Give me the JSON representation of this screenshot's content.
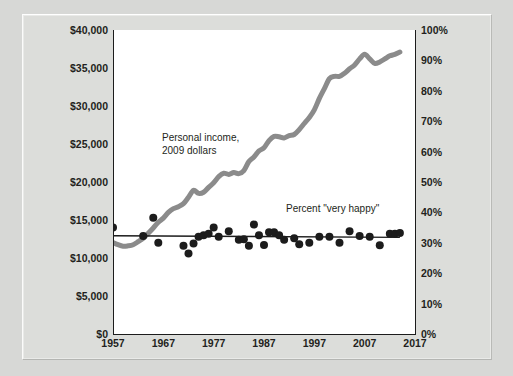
{
  "chart_data": {
    "type": "line",
    "title": "",
    "subtitle": "",
    "xlabel": "",
    "ylabel": "",
    "grid": false,
    "legend_position": "inline-annotations",
    "x": [
      1957,
      1958,
      1959,
      1960,
      1961,
      1962,
      1963,
      1964,
      1965,
      1966,
      1967,
      1968,
      1969,
      1970,
      1971,
      1972,
      1973,
      1974,
      1975,
      1976,
      1977,
      1978,
      1979,
      1980,
      1981,
      1982,
      1983,
      1984,
      1985,
      1986,
      1987,
      1988,
      1989,
      1990,
      1991,
      1992,
      1993,
      1994,
      1995,
      1996,
      1997,
      1998,
      1999,
      2000,
      2001,
      2002,
      2003,
      2004,
      2005,
      2006,
      2007,
      2008,
      2009,
      2010,
      2011,
      2012,
      2013,
      2014
    ],
    "xlim": [
      1957,
      2017
    ],
    "x_ticks": [
      "1957",
      "1967",
      "1977",
      "1987",
      "1997",
      "2007",
      "2017"
    ],
    "x_tick_values": [
      1957,
      1967,
      1977,
      1987,
      1997,
      2007,
      2017
    ],
    "axes": {
      "left": {
        "label": "Personal income, 2009 dollars",
        "ylim": [
          0,
          40000
        ],
        "ticks": [
          "$0",
          "$5,000",
          "$10,000",
          "$15,000",
          "$20,000",
          "$25,000",
          "$30,000",
          "$35,000",
          "$40,000"
        ],
        "tick_values": [
          0,
          5000,
          10000,
          15000,
          20000,
          25000,
          30000,
          35000,
          40000
        ]
      },
      "right": {
        "label": "Percent \"very happy\"",
        "ylim": [
          0,
          100
        ],
        "ticks": [
          "0%",
          "10%",
          "20%",
          "30%",
          "40%",
          "50%",
          "60%",
          "70%",
          "80%",
          "90%",
          "100%"
        ],
        "tick_values": [
          0,
          10,
          20,
          30,
          40,
          50,
          60,
          70,
          80,
          90,
          100
        ]
      }
    },
    "series": [
      {
        "name": "Personal income, 2009 dollars",
        "type": "line",
        "axis": "left",
        "color": "#8b8b8b",
        "line_width": 5,
        "values": [
          12050,
          11750,
          11550,
          11600,
          11750,
          12150,
          12600,
          13250,
          13950,
          14700,
          15250,
          16000,
          16500,
          16750,
          17150,
          18000,
          18900,
          18500,
          18650,
          19300,
          19900,
          20700,
          21150,
          21000,
          21250,
          21100,
          21500,
          22700,
          23300,
          24100,
          24500,
          25450,
          26000,
          25950,
          25800,
          26100,
          26250,
          26900,
          27700,
          28500,
          29500,
          31000,
          32300,
          33600,
          33900,
          33900,
          34300,
          34900,
          35400,
          36200,
          36800,
          36200,
          35600,
          35800,
          36200,
          36600,
          36800,
          37100
        ]
      },
      {
        "name": "Percent \"very happy\"",
        "type": "scatter",
        "axis": "right",
        "color": "#1c1c1c",
        "marker_size": 4,
        "points": [
          {
            "x": 1957,
            "y": 35.0
          },
          {
            "x": 1963,
            "y": 32.2
          },
          {
            "x": 1965,
            "y": 38.2
          },
          {
            "x": 1966,
            "y": 30.0
          },
          {
            "x": 1971,
            "y": 29.0
          },
          {
            "x": 1972,
            "y": 26.5
          },
          {
            "x": 1973,
            "y": 29.8
          },
          {
            "x": 1974,
            "y": 32.0
          },
          {
            "x": 1975,
            "y": 32.5
          },
          {
            "x": 1976,
            "y": 33.0
          },
          {
            "x": 1977,
            "y": 35.0
          },
          {
            "x": 1978,
            "y": 32.0
          },
          {
            "x": 1980,
            "y": 33.8
          },
          {
            "x": 1982,
            "y": 31.0
          },
          {
            "x": 1983,
            "y": 31.2
          },
          {
            "x": 1984,
            "y": 29.0
          },
          {
            "x": 1985,
            "y": 36.0
          },
          {
            "x": 1986,
            "y": 32.5
          },
          {
            "x": 1987,
            "y": 29.3
          },
          {
            "x": 1988,
            "y": 33.5
          },
          {
            "x": 1989,
            "y": 33.5
          },
          {
            "x": 1990,
            "y": 32.5
          },
          {
            "x": 1991,
            "y": 31.0
          },
          {
            "x": 1993,
            "y": 31.5
          },
          {
            "x": 1994,
            "y": 29.5
          },
          {
            "x": 1996,
            "y": 30.0
          },
          {
            "x": 1998,
            "y": 32.0
          },
          {
            "x": 2000,
            "y": 32.0
          },
          {
            "x": 2002,
            "y": 30.0
          },
          {
            "x": 2004,
            "y": 33.8
          },
          {
            "x": 2006,
            "y": 32.2
          },
          {
            "x": 2008,
            "y": 32.0
          },
          {
            "x": 2010,
            "y": 29.2
          },
          {
            "x": 2012,
            "y": 33.0
          },
          {
            "x": 2013,
            "y": 33.0
          },
          {
            "x": 2014,
            "y": 33.2
          }
        ]
      },
      {
        "name": "Percent \"very happy\" trend",
        "type": "line",
        "axis": "right",
        "color": "#1c1c1c",
        "line_width": 1.4,
        "trend": {
          "x_start": 1957,
          "y_start": 32.3,
          "x_end": 2014,
          "y_end": 31.8
        }
      }
    ],
    "annotations": [
      {
        "id": "income",
        "text_lines": [
          "Personal income,",
          "2009 dollars"
        ],
        "x": 1973,
        "y_left": 26800
      },
      {
        "id": "happy",
        "text_lines": [
          "Percent \"very happy\""
        ],
        "x": 2000,
        "y_right": 40
      }
    ]
  },
  "annotations": {
    "income_line1": "Personal income,",
    "income_line2": "2009 dollars",
    "happy": "Percent \"very happy\""
  },
  "colors": {
    "background": "#d7d8d6",
    "frame": "#dcddda",
    "plot_background": "#ffffff",
    "income_line": "#8b8b8b",
    "happy_marker": "#1c1c1c",
    "axis": "#1c1c1c",
    "text": "#231f20"
  }
}
